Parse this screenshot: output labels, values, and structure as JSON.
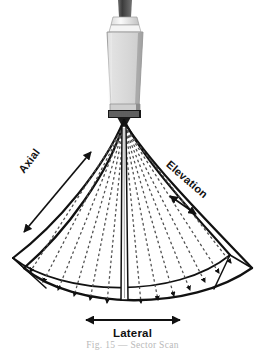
{
  "figure": {
    "caption": "Fig. 15 — Sector Scan",
    "background_color": "#ffffff",
    "ink_color": "#111111"
  },
  "labels": {
    "axial": "Axial",
    "elevation": "Elevation",
    "lateral": "Lateral"
  },
  "probe": {
    "name": "ultrasound-transducer-probe",
    "body_color": "#d5d5d5",
    "body_shade_color": "#9a9a9a",
    "collar_color": "#f2f2f2",
    "cable_color": "#4a4a4a",
    "face_color": "#1a1a1a",
    "element_count": 18
  },
  "beams": {
    "name": "sector-scan-beam-lines",
    "count": 13,
    "style": "dashed",
    "color": "#555555",
    "arrowheads": true,
    "half_angle_deg": 44
  },
  "geometry": {
    "apex_x": 124,
    "apex_y": 118,
    "fan_outer_radius": 168,
    "slab_depth_px": 22
  }
}
